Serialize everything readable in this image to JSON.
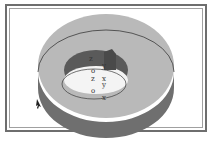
{
  "figure": {
    "type": "3d-ring-diagram",
    "colors": {
      "top_surface": "#b9b9b9",
      "side_wall": "#6f6f6f",
      "inner_wall": "#5a5a5a",
      "hole": "#f4f4f4",
      "outline": "#3a3a3a",
      "frame": "#6e6e6e"
    },
    "labels": [
      {
        "id": "z-top",
        "text": "z"
      },
      {
        "id": "y-top",
        "text": "y"
      },
      {
        "id": "o-upper",
        "text": "o"
      },
      {
        "id": "z-mid",
        "text": "z"
      },
      {
        "id": "x-mid",
        "text": "x"
      },
      {
        "id": "y-mid",
        "text": "y"
      },
      {
        "id": "o-lower",
        "text": "o"
      },
      {
        "id": "x-bottom",
        "text": "x"
      }
    ]
  }
}
